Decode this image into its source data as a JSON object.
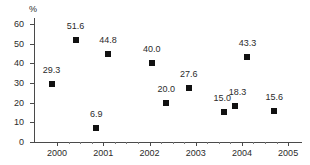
{
  "chart_data": {
    "type": "scatter",
    "title": "",
    "xlabel": "",
    "ylabel": "%",
    "y_unit_label": "%",
    "xlim": [
      1999.5,
      2005.3
    ],
    "ylim": [
      0,
      62
    ],
    "grid": false,
    "legend": false,
    "marker": "filled-square",
    "marker_color": "#111111",
    "axis_color": "#4a4a4a",
    "text_color": "#2b2b2b",
    "background_color": "#ffffff",
    "y_ticks": [
      0,
      10,
      20,
      30,
      40,
      50,
      60
    ],
    "y_tick_labels": [
      "0",
      "10",
      "20",
      "30",
      "40",
      "50",
      "60"
    ],
    "x_ticks": [
      2000,
      2001,
      2002,
      2003,
      2004,
      2005
    ],
    "x_tick_labels": [
      "2000",
      "2001",
      "2002",
      "2003",
      "2004",
      "2005"
    ],
    "x_minor_ticks": [
      2000.25,
      2000.5,
      2000.75,
      2001.25,
      2001.5,
      2001.75,
      2002.25,
      2002.5,
      2002.75,
      2003.25,
      2003.5,
      2003.75,
      2004.25,
      2004.5,
      2004.75
    ],
    "points": [
      {
        "x": 1999.88,
        "y": 29.3,
        "label": "29.3",
        "label_dx": 0,
        "label_dy": -5
      },
      {
        "x": 2000.4,
        "y": 51.6,
        "label": "51.6",
        "label_dx": 0,
        "label_dy": -5
      },
      {
        "x": 2000.85,
        "y": 6.9,
        "label": "6.9",
        "label_dx": 0,
        "label_dy": -5
      },
      {
        "x": 2001.1,
        "y": 44.8,
        "label": "44.8",
        "label_dx": 0,
        "label_dy": -5
      },
      {
        "x": 2002.05,
        "y": 40.0,
        "label": "40.0",
        "label_dx": 0,
        "label_dy": -5
      },
      {
        "x": 2002.36,
        "y": 20.0,
        "label": "20.0",
        "label_dx": 0,
        "label_dy": -5
      },
      {
        "x": 2002.85,
        "y": 27.6,
        "label": "27.6",
        "label_dx": 0,
        "label_dy": -5
      },
      {
        "x": 2003.62,
        "y": 15.0,
        "label": "15.0",
        "label_dx": -2,
        "label_dy": -5
      },
      {
        "x": 2003.86,
        "y": 18.3,
        "label": "18.3",
        "label_dx": 2,
        "label_dy": -5
      },
      {
        "x": 2004.12,
        "y": 43.3,
        "label": "43.3",
        "label_dx": 0,
        "label_dy": -5
      },
      {
        "x": 2004.7,
        "y": 15.6,
        "label": "15.6",
        "label_dx": 0,
        "label_dy": -5
      }
    ]
  }
}
